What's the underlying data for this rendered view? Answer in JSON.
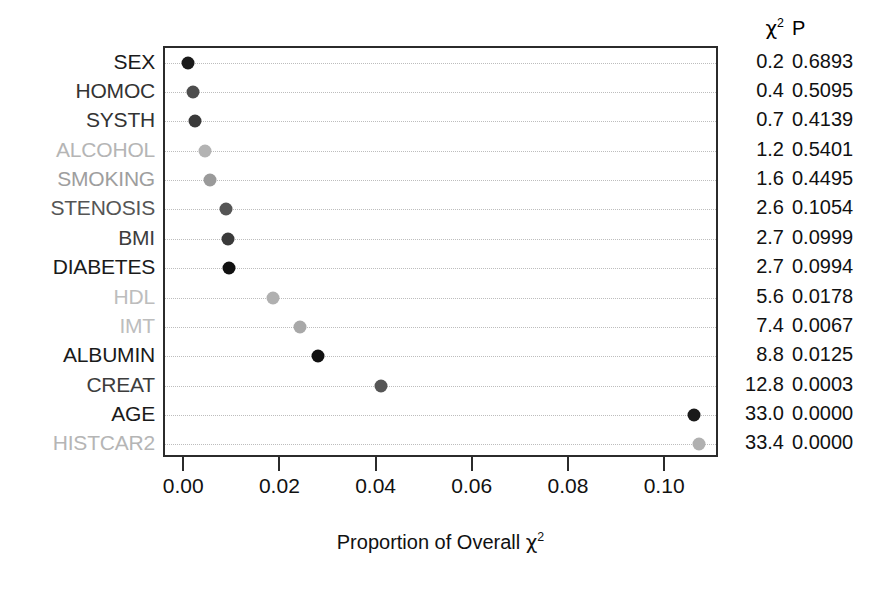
{
  "chart_data": {
    "type": "scatter",
    "title": "",
    "xlabel": "Proportion of Overall χ²",
    "ylabel": "",
    "xlim": [
      -0.0042,
      0.1112
    ],
    "xticks": [
      0.0,
      0.02,
      0.04,
      0.06,
      0.08,
      0.1
    ],
    "xticklabels": [
      "0.00",
      "0.02",
      "0.04",
      "0.06",
      "0.08",
      "0.10"
    ],
    "grid": "dotted horizontal rows",
    "legend": "none",
    "orientation": "dotchart, sorted ascending top-to-bottom",
    "categories": [
      "SEX",
      "HOMOC",
      "SYSTH",
      "ALCOHOL",
      "SMOKING",
      "STENOSIS",
      "BMI",
      "DIABETES",
      "HDL",
      "IMT",
      "ALBUMIN",
      "CREAT",
      "AGE",
      "HISTCAR2"
    ],
    "values": [
      0.0006,
      0.0017,
      0.0021,
      0.0041,
      0.0052,
      0.0085,
      0.009,
      0.0092,
      0.0183,
      0.0239,
      0.0277,
      0.0408,
      0.1058,
      0.1069
    ],
    "point_colors": [
      "#1a1a1a",
      "#4d4d4d",
      "#3a3a3a",
      "#b3b3b3",
      "#9a9a9a",
      "#555555",
      "#3a3a3a",
      "#111111",
      "#b0b0b0",
      "#a8a8a8",
      "#111111",
      "#555555",
      "#1a1a1a",
      "#b0b0b0"
    ],
    "label_colors": [
      "#1a1a1a",
      "#333333",
      "#333333",
      "#b5b5b5",
      "#9e9e9e",
      "#555555",
      "#3d3d3d",
      "#1a1a1a",
      "#bdbdbd",
      "#bdbdbd",
      "#1a1a1a",
      "#3d3d3d",
      "#1a1a1a",
      "#b5b5b5"
    ],
    "columns": [
      "χ²",
      "P"
    ],
    "chi2": [
      "0.2",
      "0.4",
      "0.7",
      "1.2",
      "1.6",
      "2.6",
      "2.7",
      "2.7",
      "5.6",
      "7.4",
      "8.8",
      "12.8",
      "33.0",
      "33.4"
    ],
    "pvalues": [
      "0.6893",
      "0.5095",
      "0.4139",
      "0.5401",
      "0.4495",
      "0.1054",
      "0.0999",
      "0.0994",
      "0.0178",
      "0.0067",
      "0.0125",
      "0.0003",
      "0.0000",
      "0.0000"
    ]
  },
  "header": {
    "chi_label": "χ",
    "chi_exponent": "2",
    "p_label": "P"
  },
  "axis": {
    "title_prefix": "Proportion of Overall ",
    "title_chi": "χ",
    "title_exponent": "2"
  }
}
